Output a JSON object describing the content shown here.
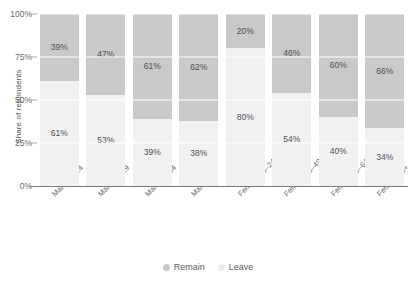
{
  "chart_data": {
    "type": "bar",
    "subtype": "stacked-100-percent",
    "title": "",
    "xlabel": "",
    "ylabel": "Share of repondents",
    "ylim": [
      0,
      100
    ],
    "yticks": [
      "0%",
      "25%",
      "50%",
      "75%",
      "100%"
    ],
    "ytick_values": [
      0,
      25,
      50,
      75,
      100
    ],
    "grid": true,
    "legend_position": "bottom-center",
    "categories": [
      "Male 18–24",
      "Male 25–49",
      "Male 50–64",
      "Male 65+",
      "Female 18–24",
      "Female 25–49",
      "Female 50–64",
      "Female 65+"
    ],
    "series": [
      {
        "name": "Remain",
        "color": "#c9c9c9",
        "values": [
          39,
          47,
          61,
          62,
          20,
          46,
          60,
          66
        ],
        "labels": [
          "39%",
          "47%",
          "61%",
          "62%",
          "20%",
          "46%",
          "60%",
          "66%"
        ]
      },
      {
        "name": "Leave",
        "color": "#f1f1f1",
        "values": [
          61,
          53,
          39,
          38,
          80,
          54,
          40,
          34
        ],
        "labels": [
          "61%",
          "53%",
          "39%",
          "38%",
          "80%",
          "54%",
          "40%",
          "34%"
        ]
      }
    ]
  },
  "legend": {
    "items": [
      {
        "label": "Remain",
        "color": "#c9c9c9"
      },
      {
        "label": "Leave",
        "color": "#ececec"
      }
    ]
  }
}
